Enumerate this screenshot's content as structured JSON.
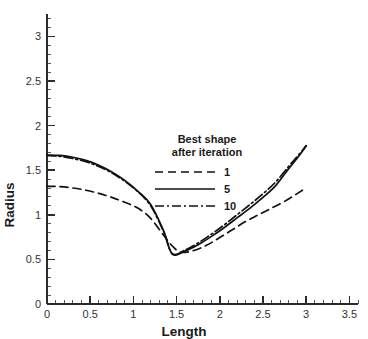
{
  "chart_data": {
    "type": "line",
    "title": "",
    "xlabel": "Length",
    "ylabel": "Radius",
    "xlim": [
      0,
      3.6
    ],
    "ylim": [
      0,
      3.25
    ],
    "grid": false,
    "legend_position": "center",
    "legend_title_line1": "Best shape",
    "legend_title_line2": "after iteration",
    "xticks": [
      0,
      0.5,
      1,
      1.5,
      2,
      2.5,
      3,
      3.5
    ],
    "xtick_labels": [
      "0",
      "0.5",
      "1",
      "1.5",
      "2",
      "2.5",
      "3",
      "3.5"
    ],
    "yticks": [
      0,
      0.5,
      1,
      1.5,
      2,
      2.5,
      3
    ],
    "ytick_labels": [
      "0",
      "0.5",
      "1",
      "1.5",
      "2",
      "2.5",
      "3"
    ],
    "x_minor_tick_step": 0.1,
    "y_minor_tick_step": 0.1,
    "series": [
      {
        "name": "1",
        "style": "dashed",
        "color": "#111111",
        "x": [
          0.0,
          0.15,
          0.3,
          0.45,
          0.6,
          0.75,
          0.9,
          1.05,
          1.2,
          1.35,
          1.45,
          1.55,
          1.7,
          1.85,
          2.0,
          2.15,
          2.3,
          2.45,
          2.6,
          2.75,
          2.9,
          3.0
        ],
        "y": [
          1.32,
          1.315,
          1.3,
          1.275,
          1.24,
          1.195,
          1.14,
          1.075,
          0.96,
          0.77,
          0.65,
          0.58,
          0.6,
          0.66,
          0.745,
          0.835,
          0.925,
          1.0,
          1.075,
          1.15,
          1.24,
          1.3
        ]
      },
      {
        "name": "5",
        "style": "solid",
        "color": "#111111",
        "x": [
          0.0,
          0.15,
          0.3,
          0.45,
          0.6,
          0.75,
          0.9,
          1.05,
          1.2,
          1.35,
          1.45,
          1.6,
          1.75,
          1.9,
          2.05,
          2.2,
          2.35,
          2.5,
          2.65,
          2.8,
          2.9,
          3.0
        ],
        "y": [
          1.67,
          1.665,
          1.645,
          1.61,
          1.555,
          1.48,
          1.385,
          1.265,
          1.115,
          0.82,
          0.56,
          0.595,
          0.665,
          0.755,
          0.855,
          0.965,
          1.075,
          1.195,
          1.33,
          1.52,
          1.64,
          1.77
        ]
      },
      {
        "name": "10",
        "style": "dash-dot",
        "color": "#111111",
        "x": [
          0.0,
          0.15,
          0.3,
          0.45,
          0.6,
          0.75,
          0.9,
          1.05,
          1.2,
          1.35,
          1.45,
          1.6,
          1.75,
          1.9,
          2.05,
          2.2,
          2.35,
          2.5,
          2.65,
          2.8,
          2.9,
          3.0
        ],
        "y": [
          1.665,
          1.655,
          1.63,
          1.595,
          1.54,
          1.47,
          1.375,
          1.26,
          1.1,
          0.81,
          0.565,
          0.605,
          0.685,
          0.78,
          0.885,
          1.0,
          1.115,
          1.235,
          1.37,
          1.545,
          1.655,
          1.775
        ]
      }
    ]
  }
}
